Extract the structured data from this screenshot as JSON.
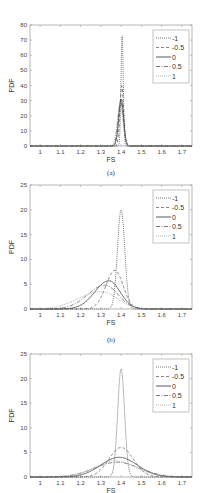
{
  "chart_data": [
    {
      "type": "line",
      "panel": "(a)",
      "caption": "(a)",
      "xlabel": "FS",
      "ylabel": "PDF",
      "xlim": [
        0.95,
        1.75
      ],
      "ylim": [
        0,
        80
      ],
      "xticks": [
        "1",
        "1.1",
        "1.2",
        "1.3",
        "1.4",
        "1.5",
        "1.6",
        "1.7"
      ],
      "yticks": [
        "0",
        "10",
        "20",
        "30",
        "40",
        "50",
        "60",
        "70",
        "80"
      ],
      "legend_position": "upper right",
      "series": [
        {
          "name": "-1",
          "style": "dotted",
          "peak_x": 1.405,
          "peak_y": 74,
          "sigma": 0.0055
        },
        {
          "name": "-0.5",
          "style": "dashed",
          "peak_x": 1.403,
          "peak_y": 40,
          "sigma": 0.009
        },
        {
          "name": "0",
          "style": "solid",
          "peak_x": 1.4,
          "peak_y": 31,
          "sigma": 0.012
        },
        {
          "name": "0.5",
          "style": "dashdot",
          "peak_x": 1.398,
          "peak_y": 29,
          "sigma": 0.013
        },
        {
          "name": "1",
          "style": "dotted-light",
          "peak_x": 1.395,
          "peak_y": 28,
          "sigma": 0.014
        }
      ]
    },
    {
      "type": "line",
      "panel": "(b)",
      "caption": "(b)",
      "xlabel": "FS",
      "ylabel": "PDF",
      "xlim": [
        0.95,
        1.75
      ],
      "ylim": [
        0,
        25
      ],
      "xticks": [
        "1",
        "1.1",
        "1.2",
        "1.3",
        "1.4",
        "1.5",
        "1.6",
        "1.7"
      ],
      "yticks": [
        "0",
        "5",
        "10",
        "15",
        "20",
        "25"
      ],
      "legend_position": "upper right",
      "series": [
        {
          "name": "-1",
          "style": "dotted",
          "peak_x": 1.4,
          "peak_y": 20,
          "sigma_left": 0.018,
          "sigma_right": 0.018
        },
        {
          "name": "-0.5",
          "style": "dashed",
          "peak_x": 1.37,
          "peak_y": 7.8,
          "sigma_left": 0.045,
          "sigma_right": 0.04
        },
        {
          "name": "0",
          "style": "solid",
          "peak_x": 1.34,
          "peak_y": 5.7,
          "sigma_left": 0.07,
          "sigma_right": 0.055
        },
        {
          "name": "0.5",
          "style": "dashdot",
          "peak_x": 1.32,
          "peak_y": 4.8,
          "sigma_left": 0.085,
          "sigma_right": 0.065
        },
        {
          "name": "1",
          "style": "dotted-light",
          "peak_x": 1.3,
          "peak_y": 3.5,
          "sigma_left": 0.11,
          "sigma_right": 0.08
        }
      ]
    },
    {
      "type": "line",
      "panel": "(c)",
      "caption": "",
      "xlabel": "FS",
      "ylabel": "PDF",
      "xlim": [
        0.95,
        1.75
      ],
      "ylim": [
        0,
        25
      ],
      "xticks": [
        "1",
        "1.1",
        "1.2",
        "1.3",
        "1.4",
        "1.5",
        "1.6",
        "1.7"
      ],
      "yticks": [
        "0",
        "5",
        "10",
        "15",
        "20",
        "25"
      ],
      "legend_position": "upper right",
      "series": [
        {
          "name": "-1",
          "style": "dotted",
          "peak_x": 1.4,
          "peak_y": 22,
          "sigma_left": 0.017,
          "sigma_right": 0.017
        },
        {
          "name": "-0.5",
          "style": "dashed",
          "peak_x": 1.4,
          "peak_y": 6.0,
          "sigma_left": 0.06,
          "sigma_right": 0.06
        },
        {
          "name": "0",
          "style": "solid",
          "peak_x": 1.39,
          "peak_y": 4.0,
          "sigma_left": 0.09,
          "sigma_right": 0.09
        },
        {
          "name": "0.5",
          "style": "dashdot",
          "peak_x": 1.38,
          "peak_y": 3.0,
          "sigma_left": 0.11,
          "sigma_right": 0.11
        },
        {
          "name": "1",
          "style": "dotted-light",
          "peak_x": 1.37,
          "peak_y": 3.3,
          "sigma_left": 0.1,
          "sigma_right": 0.1
        }
      ]
    }
  ],
  "panels": [
    {
      "caption": "(a)",
      "xlabel": "FS",
      "ylabel": "PDF"
    },
    {
      "caption": "(b)",
      "xlabel": "FS",
      "ylabel": "PDF"
    },
    {
      "caption": "",
      "xlabel": "FS",
      "ylabel": "PDF"
    }
  ],
  "legend_labels": [
    "-1",
    "-0.5",
    "0",
    "0.5",
    "1"
  ]
}
